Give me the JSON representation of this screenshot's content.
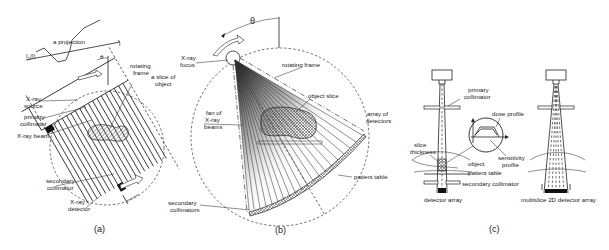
{
  "figure": {
    "panels": [
      {
        "id": "a",
        "caption": "(a)",
        "labels": {
          "projection": "a projection",
          "axis_l": "I",
          "axis_l_sub": "θ",
          "axis_l_arg": "(l)",
          "theta": "θ",
          "l_symbol": "l",
          "rotating_frame_1": "rotating",
          "rotating_frame_2": "frame",
          "slice_1": "a slice of",
          "slice_2": "object",
          "xray_source_1": "X-ray",
          "xray_source_2": "source",
          "primary_collimator_1": "primary",
          "primary_collimator_2": "collimator",
          "xray_beam": "X-ray beam",
          "secondary_collimator_1": "secondary",
          "secondary_collimator_2": "collimator",
          "xray_detector_1": "X-ray",
          "xray_detector_2": "detector"
        }
      },
      {
        "id": "b",
        "caption": "(b)",
        "labels": {
          "theta": "θ",
          "xray_focus_1": "X-ray",
          "xray_focus_2": "focus",
          "rotating_frame": "rotating frame",
          "object_slice": "object slice",
          "array_detectors_1": "array of",
          "array_detectors_2": "detectors",
          "fan_1": "fan of",
          "fan_2": "X-ray",
          "fan_3": "beams",
          "patient_table": "patient table",
          "secondary_collimators_1": "secondary",
          "secondary_collimators_2": "collimators"
        }
      },
      {
        "id": "c",
        "caption": "(c)",
        "labels": {
          "primary_collimator_1": "primary",
          "primary_collimator_2": "collimator",
          "dose_profile": "dose profile",
          "slice_thickness_1": "slice",
          "slice_thickness_2": "thickness",
          "sensitivity_profile_1": "sensitivity",
          "sensitivity_profile_2": "profile",
          "object": "object",
          "patient_table": "patient table",
          "secondary_collimator": "secondary collimator",
          "detector_array": "detector array",
          "multislice_detector_array": "multislice 2D detector array"
        }
      }
    ]
  }
}
